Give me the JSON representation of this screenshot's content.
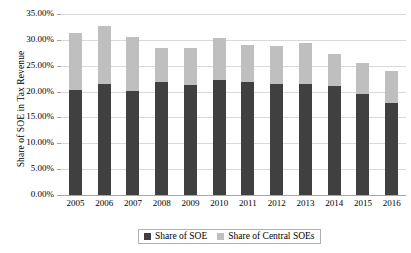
{
  "chart_data": {
    "type": "bar",
    "subtype": "stacked",
    "title": "",
    "xlabel": "",
    "ylabel": "Share of SOE in Tax Revenue",
    "ylim": [
      0,
      35
    ],
    "ytick_labels": [
      "35.00%",
      "30.00%",
      "25.00%",
      "20.00%",
      "15.00%",
      "10.00%",
      "5.00%",
      "0.00%"
    ],
    "ytick_values": [
      35,
      30,
      25,
      20,
      15,
      10,
      5,
      0
    ],
    "grid": true,
    "legend_position": "bottom",
    "categories": [
      "2005",
      "2006",
      "2007",
      "2008",
      "2009",
      "2010",
      "2011",
      "2012",
      "2013",
      "2014",
      "2015",
      "2016"
    ],
    "series": [
      {
        "name": "Share of SOE",
        "color": "#404040",
        "values": [
          20.4,
          21.4,
          20.2,
          21.8,
          21.3,
          22.2,
          21.9,
          21.5,
          21.5,
          21.0,
          19.5,
          17.7
        ]
      },
      {
        "name": "Share of Central SOEs",
        "color": "#bfbfbf",
        "values": [
          10.9,
          11.3,
          10.3,
          6.6,
          7.1,
          8.1,
          7.1,
          7.3,
          7.9,
          6.2,
          6.0,
          6.3
        ]
      }
    ],
    "totals": [
      31.3,
      32.7,
      30.5,
      28.4,
      28.4,
      30.3,
      29.0,
      28.8,
      29.4,
      27.2,
      25.5,
      24.0
    ]
  },
  "legend": {
    "items": [
      {
        "label": "Share of SOE",
        "color": "#404040"
      },
      {
        "label": "Share of Central SOEs",
        "color": "#bfbfbf"
      }
    ]
  },
  "colors": {
    "series_dark": "#404040",
    "series_light": "#bfbfbf",
    "gridline": "#d9d9d9",
    "axis": "#a6a6a6",
    "background": "#ffffff"
  }
}
